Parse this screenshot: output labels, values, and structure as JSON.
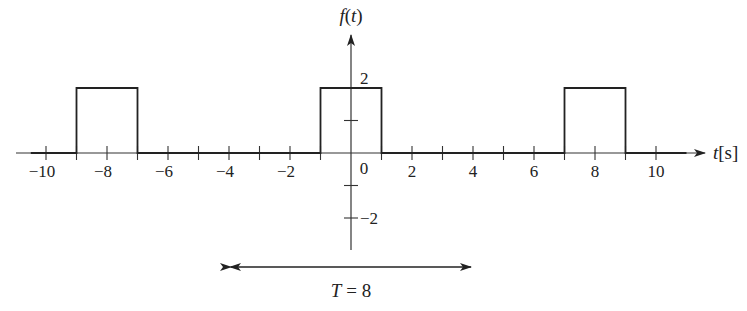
{
  "chart_data": {
    "type": "line",
    "title": "",
    "xlabel": "t[s]",
    "ylabel": "f(t)",
    "xlim": [
      -11,
      11.5
    ],
    "ylim": [
      -3,
      3.6
    ],
    "grid": false,
    "x_ticks": [
      -10,
      -9,
      -8,
      -7,
      -6,
      -5,
      -4,
      -3,
      -2,
      -1,
      1,
      2,
      3,
      4,
      5,
      6,
      7,
      8,
      9,
      10
    ],
    "x_tick_labels": [
      {
        "value": -10,
        "label": "−10"
      },
      {
        "value": -8,
        "label": "−8"
      },
      {
        "value": -6,
        "label": "−6"
      },
      {
        "value": -4,
        "label": "−4"
      },
      {
        "value": -2,
        "label": "−2"
      },
      {
        "value": 2,
        "label": "2"
      },
      {
        "value": 4,
        "label": "4"
      },
      {
        "value": 6,
        "label": "6"
      },
      {
        "value": 8,
        "label": "8"
      },
      {
        "value": 10,
        "label": "10"
      }
    ],
    "origin_label": "0",
    "y_ticks": [
      -2,
      -1,
      1,
      2
    ],
    "y_tick_labels": [
      {
        "value": 2,
        "label": "2"
      },
      {
        "value": -2,
        "label": "−2"
      }
    ],
    "series": [
      {
        "name": "f(t)",
        "x": [
          -11,
          -9,
          -9,
          -7,
          -7,
          -1,
          -1,
          1,
          1,
          7,
          7,
          9,
          9,
          11
        ],
        "values": [
          0,
          0,
          2,
          2,
          0,
          0,
          2,
          2,
          0,
          0,
          2,
          2,
          0,
          0
        ]
      }
    ],
    "pulses": [
      {
        "start": -9,
        "end": -7,
        "amplitude": 2
      },
      {
        "start": -1,
        "end": 1,
        "amplitude": 2
      },
      {
        "start": 7,
        "end": 9,
        "amplitude": 2
      }
    ],
    "annotations": [
      {
        "type": "double-arrow",
        "from": -4,
        "to": 4,
        "label": "T = 8"
      }
    ],
    "period": 8
  },
  "style": {
    "line_color": "#222222",
    "axis_color": "#333333",
    "background": "#ffffff"
  }
}
